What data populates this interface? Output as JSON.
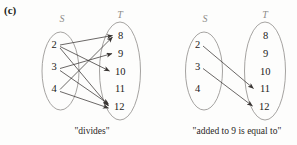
{
  "figure": {
    "part_label": "(c)",
    "background_color": "#fdfdfc",
    "oval_stroke_color": "#9b9896",
    "arrow_color": "#3a3634",
    "set_label_color": "#8e8c8a"
  },
  "panels": [
    {
      "id": "divides-panel",
      "caption": "\"divides\"",
      "domain_label": "S",
      "codomain_label": "T",
      "domain_elements": [
        "2",
        "3",
        "4"
      ],
      "codomain_elements": [
        "8",
        "9",
        "10",
        "11",
        "12"
      ],
      "arrows": [
        {
          "from": "2",
          "to": "8"
        },
        {
          "from": "2",
          "to": "10"
        },
        {
          "from": "2",
          "to": "12"
        },
        {
          "from": "3",
          "to": "9"
        },
        {
          "from": "3",
          "to": "12"
        },
        {
          "from": "4",
          "to": "8"
        },
        {
          "from": "4",
          "to": "12"
        }
      ]
    },
    {
      "id": "added-to-9-panel",
      "caption": "\"added to 9 is equal to\"",
      "domain_label": "S",
      "codomain_label": "T",
      "domain_elements": [
        "2",
        "3",
        "4"
      ],
      "codomain_elements": [
        "8",
        "9",
        "10",
        "11",
        "12"
      ],
      "arrows": [
        {
          "from": "2",
          "to": "11"
        },
        {
          "from": "3",
          "to": "12"
        }
      ]
    }
  ]
}
